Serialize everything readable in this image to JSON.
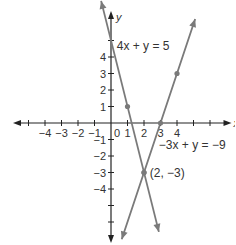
{
  "chart_data": {
    "type": "line",
    "title": "",
    "xlabel": "x",
    "ylabel": "y",
    "xlim": [
      -6,
      7
    ],
    "ylim": [
      -7,
      6
    ],
    "grid": false,
    "x_ticks": [
      -5,
      -4,
      -3,
      -2,
      -1,
      1,
      2,
      3,
      4,
      5,
      6
    ],
    "x_tick_labels": [
      {
        "value": -4,
        "label": "−4"
      },
      {
        "value": -3,
        "label": "−3"
      },
      {
        "value": -2,
        "label": "−2"
      },
      {
        "value": -1,
        "label": "−1"
      },
      {
        "value": 0,
        "label": "0"
      },
      {
        "value": 1,
        "label": "1"
      },
      {
        "value": 2,
        "label": "2"
      },
      {
        "value": 3,
        "label": "3"
      },
      {
        "value": 4,
        "label": "4"
      }
    ],
    "y_ticks": [
      -6,
      -5,
      -4,
      -3,
      -2,
      -1,
      1,
      2,
      3,
      4,
      5
    ],
    "y_tick_labels": [
      {
        "value": 4,
        "label": "4"
      },
      {
        "value": 3,
        "label": "3"
      },
      {
        "value": 2,
        "label": "2"
      },
      {
        "value": 1,
        "label": "1"
      },
      {
        "value": -1,
        "label": "−1"
      },
      {
        "value": -2,
        "label": "−2"
      },
      {
        "value": -3,
        "label": "−3"
      },
      {
        "value": -4,
        "label": "−4"
      }
    ],
    "series": [
      {
        "name": "4x + y = 5",
        "slope": -4,
        "intercept": 5,
        "x_range": [
          -0.6,
          2.9
        ],
        "points": [
          [
            1,
            1
          ],
          [
            2,
            -3
          ]
        ]
      },
      {
        "name": "−3x + y = −9",
        "slope": 3,
        "intercept": -9,
        "x_range": [
          0.65,
          5.1
        ],
        "points": [
          [
            2,
            -3
          ],
          [
            3,
            0
          ],
          [
            4,
            3
          ]
        ]
      }
    ],
    "annotations": [
      {
        "text": "4x + y = 5",
        "x": 0.35,
        "y": 4.4
      },
      {
        "text": "−3x + y = −9",
        "x": 2.9,
        "y": -1.6
      },
      {
        "text": "(2, −3)",
        "x": 2.35,
        "y": -3.25
      }
    ],
    "line_color": "#7a7a7a",
    "axis_color": "#222222"
  }
}
